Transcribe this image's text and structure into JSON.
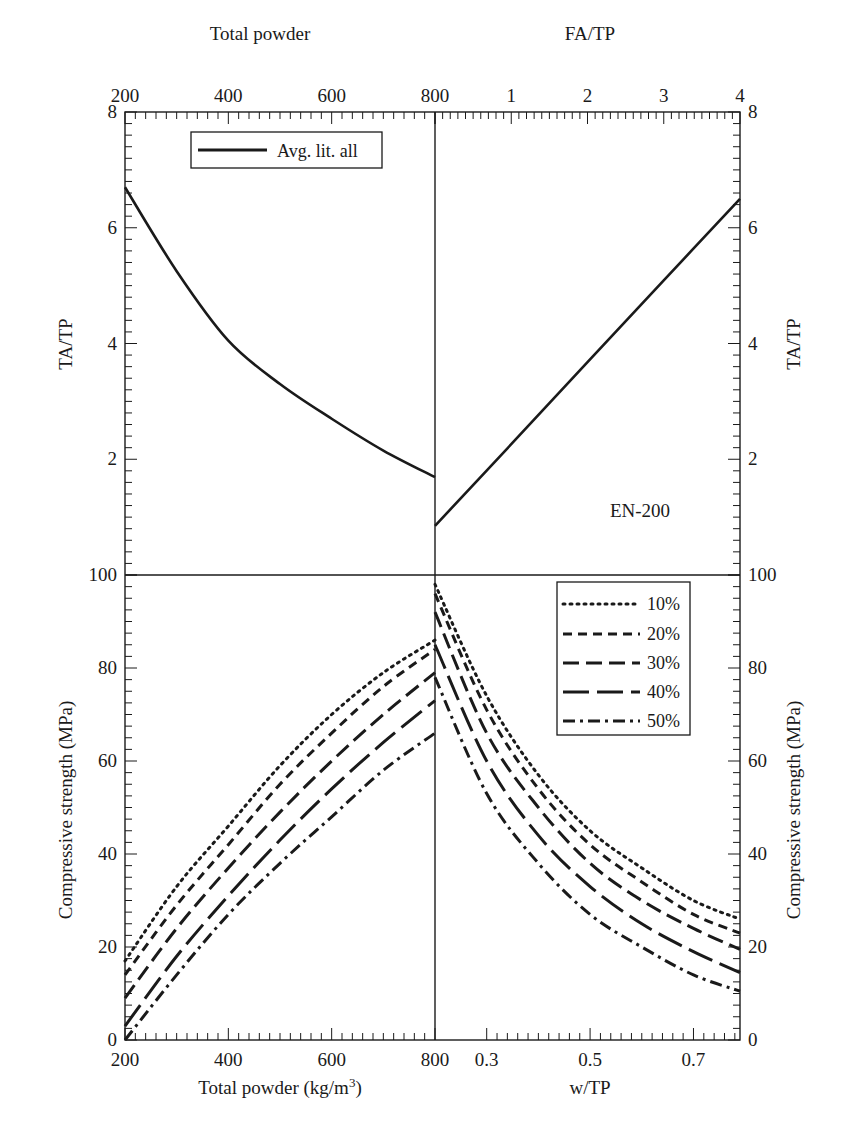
{
  "chart_data": [
    {
      "panel": "top-left",
      "type": "line",
      "title": "",
      "xlabel": "Total powder",
      "ylabel": "TA/TP",
      "xlim": [
        200,
        800
      ],
      "ylim": [
        0,
        8
      ],
      "x_ticks": [
        200,
        400,
        600,
        800
      ],
      "y_ticks": [
        2,
        4,
        6,
        8
      ],
      "legend": [
        "Avg. lit. all"
      ],
      "legend_position": "upper-left",
      "series": [
        {
          "name": "Avg. lit. all",
          "style": "solid",
          "x": [
            200,
            300,
            400,
            500,
            600,
            700,
            800
          ],
          "y": [
            6.7,
            5.25,
            4.05,
            3.3,
            2.7,
            2.15,
            1.69
          ]
        }
      ]
    },
    {
      "panel": "top-right",
      "type": "line",
      "xlabel": "FA/TP",
      "ylabel": "TA/TP",
      "xlim": [
        0,
        4
      ],
      "ylim": [
        0,
        8
      ],
      "x_ticks": [
        1,
        2,
        3,
        4
      ],
      "y_ticks": [
        2,
        4,
        6,
        8
      ],
      "annotation": "EN-200",
      "series": [
        {
          "name": "Avg. lit. all",
          "style": "solid",
          "x": [
            0,
            1,
            2,
            3,
            4
          ],
          "y": [
            0.85,
            2.26,
            3.68,
            5.09,
            6.5
          ]
        }
      ]
    },
    {
      "panel": "bottom-left",
      "type": "line",
      "xlabel": "Total powder (kg/m³)",
      "ylabel": "Compressive strength (MPa)",
      "xlim": [
        200,
        800
      ],
      "ylim": [
        0,
        100
      ],
      "x_ticks": [
        200,
        400,
        600,
        800
      ],
      "y_ticks": [
        0,
        20,
        40,
        60,
        80,
        100
      ],
      "x": [
        200,
        300,
        400,
        500,
        600,
        700,
        800
      ],
      "series": [
        {
          "name": "10%",
          "style": "dotted",
          "values": [
            17,
            33,
            46,
            59,
            70,
            79,
            86
          ]
        },
        {
          "name": "20%",
          "style": "short-dash",
          "values": [
            14,
            29,
            42,
            55,
            66,
            76,
            84
          ]
        },
        {
          "name": "30%",
          "style": "medium-dash",
          "values": [
            9,
            24,
            37,
            49,
            60,
            70,
            79
          ]
        },
        {
          "name": "40%",
          "style": "long-dash",
          "values": [
            3,
            18,
            31,
            43,
            54,
            64,
            73
          ]
        },
        {
          "name": "50%",
          "style": "dash-dot",
          "values": [
            0,
            14,
            27,
            38,
            48,
            58,
            66
          ]
        }
      ]
    },
    {
      "panel": "bottom-right",
      "type": "line",
      "xlabel": "w/TP",
      "ylabel": "Compressive strength (MPa)",
      "xlim": [
        0.2,
        0.79
      ],
      "ylim": [
        0,
        100
      ],
      "x_ticks": [
        0.3,
        0.5,
        0.7
      ],
      "y_ticks": [
        0,
        20,
        40,
        60,
        80,
        100
      ],
      "legend": [
        "10%",
        "20%",
        "30%",
        "40%",
        "50%"
      ],
      "legend_position": "upper-right",
      "x": [
        0.2,
        0.3,
        0.4,
        0.5,
        0.6,
        0.7,
        0.79
      ],
      "series": [
        {
          "name": "10%",
          "style": "dotted",
          "values": [
            98,
            74,
            57,
            45,
            37,
            30,
            26
          ]
        },
        {
          "name": "20%",
          "style": "short-dash",
          "values": [
            96,
            71,
            54,
            42,
            34,
            27,
            23
          ]
        },
        {
          "name": "30%",
          "style": "medium-dash",
          "values": [
            92,
            66,
            50,
            38,
            30,
            24,
            19.5
          ]
        },
        {
          "name": "40%",
          "style": "long-dash",
          "values": [
            85,
            60,
            44,
            33,
            25,
            19,
            14.5
          ]
        },
        {
          "name": "50%",
          "style": "dash-dot",
          "values": [
            78,
            53,
            38,
            27,
            20,
            14,
            10.5
          ]
        }
      ]
    }
  ],
  "labels": {
    "top_left_axis_title": "Total powder",
    "top_right_axis_title": "FA/TP",
    "left_top_ylabel": "TA/TP",
    "right_top_ylabel": "TA/TP",
    "left_bottom_ylabel": "Compressive strength (MPa)",
    "right_bottom_ylabel": "Compressive strength (MPa)",
    "bottom_left_xlabel": "Total powder (kg/m",
    "bottom_left_xlabel_sup": "3",
    "bottom_left_xlabel_end": ")",
    "bottom_right_xlabel": "w/TP",
    "annotation": "EN-200",
    "top_legend": "Avg. lit. all",
    "bottom_legend": [
      "10%",
      "20%",
      "30%",
      "40%",
      "50%"
    ],
    "top_x_ticks_left": [
      "200",
      "400",
      "600",
      "800"
    ],
    "top_x_ticks_right": [
      "1",
      "2",
      "3",
      "4"
    ],
    "top_y_ticks": [
      "2",
      "4",
      "6",
      "8"
    ],
    "bottom_y_ticks": [
      "0",
      "20",
      "40",
      "60",
      "80",
      "100"
    ],
    "bottom_x_ticks_left": [
      "200",
      "400",
      "600",
      "800"
    ],
    "bottom_x_ticks_right": [
      "0.3",
      "0.5",
      "0.7"
    ]
  },
  "colors": {
    "line": "#1a1a1a",
    "background": "#ffffff"
  }
}
